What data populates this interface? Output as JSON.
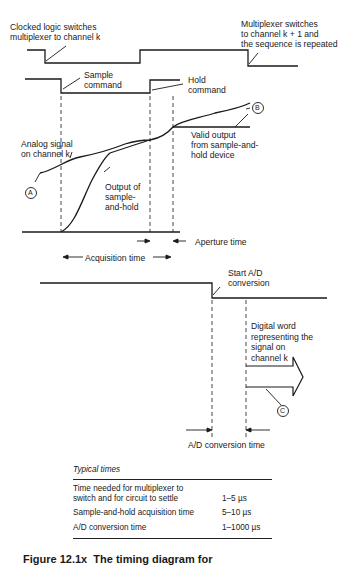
{
  "diagram": {
    "labels": {
      "clocked_logic": "Clocked logic switches\nmultiplexer to channel k",
      "multiplexer_switches": "Multiplexer switches\nto channel k + 1 and\nthe sequence is repeated",
      "sample_command": "Sample\ncommand",
      "hold_command": "Hold\ncommand",
      "analog_signal": "Analog signal\non channel k",
      "output_sample_hold": "Output of\nsample-\nand-hold",
      "valid_output": "Valid output\nfrom sample-and-\nhold device",
      "aperture_time": "Aperture time",
      "acquisition_time": "Acquisition time",
      "start_ad": "Start A/D\nconversion",
      "digital_word": "Digital word\nrepresenting the\nsignal on\nchannel k",
      "ad_conversion_time": "A/D conversion time"
    },
    "markers": {
      "a": "A",
      "b": "B",
      "c": "C"
    }
  },
  "table": {
    "title": "Typical times",
    "rows": [
      {
        "label": "Time needed for multiplexer to\nswitch and for circuit to settle",
        "value": "1–5 µs"
      },
      {
        "label": "Sample-and-hold acquisition time",
        "value": "5–10 µs"
      },
      {
        "label": "A/D conversion time",
        "value": "1–1000 µs"
      }
    ]
  },
  "caption": "Figure 12.1x  The timing diagram for"
}
